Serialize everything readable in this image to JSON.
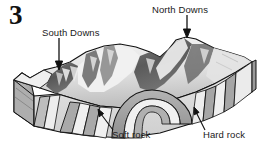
{
  "figure": {
    "number": "3",
    "kind": "geological-block-diagram",
    "caption_labels": [
      "South Downs",
      "North Downs",
      "Soft rock",
      "Hard rock"
    ]
  },
  "labels": {
    "south_downs": "South Downs",
    "north_downs": "North Downs",
    "soft_rock": "Soft rock",
    "hard_rock": "Hard rock"
  },
  "annotations": [
    {
      "name": "south-downs-arrow",
      "points_to": "left escarpment crest",
      "direction": "down"
    },
    {
      "name": "north-downs-arrow",
      "points_to": "right escarpment crest",
      "direction": "down"
    },
    {
      "name": "soft-rock-arrow",
      "points_to": "soft rock band in front cross-section",
      "direction": "up-left"
    },
    {
      "name": "hard-rock-arrow",
      "points_to": "hard rock band in front cross-section",
      "direction": "up-left"
    }
  ],
  "colors": {
    "background": "#ffffff",
    "outline": "#111111",
    "text": "#1a1a1a",
    "terrain_light": "#f1f1f1",
    "terrain_mid": "#c9c9c9",
    "terrain_dark": "#4a4a4a",
    "terrain_darkest": "#333333",
    "rock_hard": "#a8a8a8",
    "rock_soft": "#eeeeee",
    "side_face": "#b6b6b6",
    "front_face": "#dcdcdc"
  },
  "geology": {
    "structure": "eroded anticline",
    "hard_rock_bands": 4,
    "soft_rock_bands": 3,
    "escarpments": [
      "South Downs",
      "North Downs"
    ],
    "central_feature": "breached arch / vale"
  }
}
